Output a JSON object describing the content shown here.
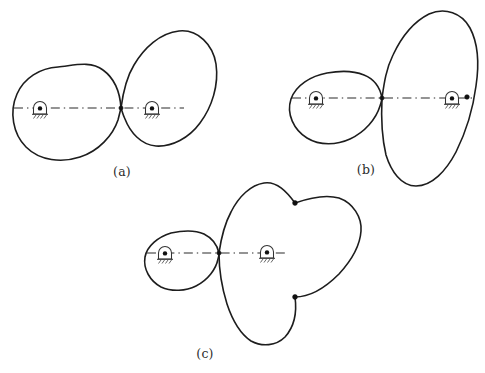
{
  "figure": {
    "background_color": "#ffffff",
    "curve_color": "#1d1d1d",
    "center_line_color": "#2a2a2a",
    "marker_color": "#101010",
    "width": 485,
    "height": 373
  },
  "panels": [
    {
      "id": "a",
      "caption": "(a)",
      "caption_x": 122,
      "caption_y": 172,
      "description": "Two ovals of nearly equal size meeting at a single contact point",
      "contact_point": {
        "x": 121,
        "y": 108
      },
      "center_line": {
        "x1": 14,
        "y1": 108,
        "x2": 184,
        "y2": 108
      },
      "pivots": [
        {
          "name": "left-pivot",
          "x": 40,
          "y": 108
        },
        {
          "name": "right-pivot",
          "x": 152,
          "y": 108
        }
      ],
      "node_markers": [],
      "curves": [
        {
          "name": "driver-pitch-curve",
          "path": "M 121 108 C 120 92 114 78 103 70 C 90 60 72 66 58 67 C 40 68 24 78 17 94 C 9 112 13 134 26 147 C 40 161 62 163 80 157 C 99 151 113 135 118 120 C 119 116 120 112 121 108 Z"
        },
        {
          "name": "driven-pitch-curve",
          "path": "M 121 108 C 123 93 126 78 134 65 C 144 48 160 33 179 31 C 198 29 213 45 216 64 C 219 85 212 107 200 123 C 189 138 172 147 156 146 C 141 145 130 132 125 119 C 123 115 122 111 121 108 Z"
        }
      ]
    },
    {
      "id": "b",
      "caption": "(b)",
      "caption_x": 366,
      "caption_y": 170,
      "description": "Small oval driving a large elongated tilted oval, one node marker on the far edge",
      "contact_point": {
        "x": 382,
        "y": 98
      },
      "center_line": {
        "x1": 292,
        "y1": 98,
        "x2": 472,
        "y2": 98
      },
      "pivots": [
        {
          "name": "left-pivot",
          "x": 316,
          "y": 98
        },
        {
          "name": "right-pivot",
          "x": 452,
          "y": 98
        }
      ],
      "node_markers": [
        {
          "name": "node-marker-right",
          "x": 467,
          "y": 97
        }
      ],
      "curves": [
        {
          "name": "driver-pitch-curve",
          "path": "M 382 98 C 380 87 374 79 364 75 C 352 70 338 71 327 73 C 311 76 296 85 291 99 C 286 114 294 130 307 138 C 320 146 337 145 350 139 C 365 132 376 119 380 106 C 381 103 382 100 382 98 Z"
        },
        {
          "name": "driven-pitch-curve",
          "path": "M 382 98 C 384 84 386 69 393 55 C 401 38 413 22 429 14 C 445 7 462 13 470 28 C 479 45 479 66 476 86 C 473 109 466 132 456 152 C 446 171 432 186 416 186 C 401 186 391 171 386 155 C 382 138 381 118 382 98 Z"
        }
      ]
    },
    {
      "id": "c",
      "caption": "(c)",
      "caption_x": 205,
      "caption_y": 354,
      "description": "Small oval driving a large three-lobed pitch curve, two node markers",
      "contact_point": {
        "x": 219,
        "y": 253
      },
      "center_line": {
        "x1": 147,
        "y1": 253,
        "x2": 287,
        "y2": 253
      },
      "pivots": [
        {
          "name": "left-pivot",
          "x": 165,
          "y": 253
        },
        {
          "name": "right-pivot",
          "x": 267,
          "y": 252
        }
      ],
      "node_markers": [
        {
          "name": "node-marker-upper",
          "x": 295,
          "y": 203
        },
        {
          "name": "node-marker-lower",
          "x": 295,
          "y": 297
        }
      ],
      "curves": [
        {
          "name": "driver-pitch-curve",
          "path": "M 219 253 C 217 244 212 238 204 234 C 193 229 180 231 171 233 C 158 237 147 246 145 257 C 143 269 150 281 161 287 C 172 292 186 291 196 286 C 208 280 216 269 218 259 C 219 256 219 254 219 253 Z"
        },
        {
          "name": "driven-pitch-curve",
          "path": "M 219 253 C 221 240 224 227 230 215 C 238 199 250 186 263 183 C 276 180 286 192 295 203 C 308 198 324 194 338 198 C 352 202 361 216 361 230 C 361 246 352 261 341 273 C 326 288 310 297 295 297 C 297 311 294 326 285 336 C 276 345 262 347 251 341 C 239 334 232 320 227 305 C 222 289 219 271 219 253 Z"
        }
      ]
    }
  ],
  "pivot_symbol": {
    "name": "fixed-pivot-support",
    "arch_radius": 6.5,
    "base_half_width": 8,
    "hatch_count": 4,
    "hatch_length": 4.5
  }
}
